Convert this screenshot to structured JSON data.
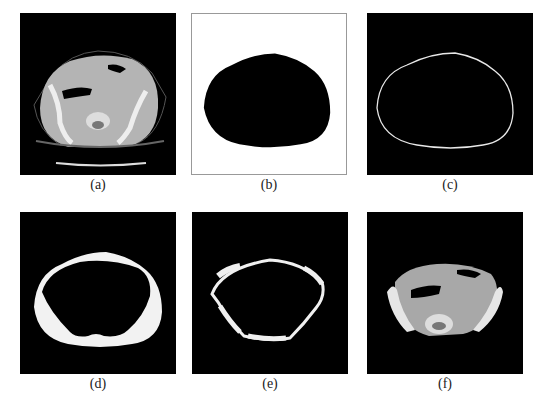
{
  "figure": {
    "panels": [
      {
        "label": "(a)",
        "description": "Original abdominal CT slice"
      },
      {
        "label": "(b)",
        "description": "Binary body mask (black on white)"
      },
      {
        "label": "(c)",
        "description": "Body contour outline"
      },
      {
        "label": "(d)",
        "description": "Subcutaneous fat region (white ring)"
      },
      {
        "label": "(e)",
        "description": "Abdominal wall / muscle ring"
      },
      {
        "label": "(f)",
        "description": "Segmented inner abdominal region"
      }
    ],
    "colors": {
      "background": "#ffffff",
      "image_background": "#000000",
      "mask_foreground": "#000000",
      "contour": "#e8e8e8",
      "fat_region": "#f2f2f2",
      "tissue_gray": "#a8a8a8",
      "bone": "#e6e6e6"
    }
  }
}
